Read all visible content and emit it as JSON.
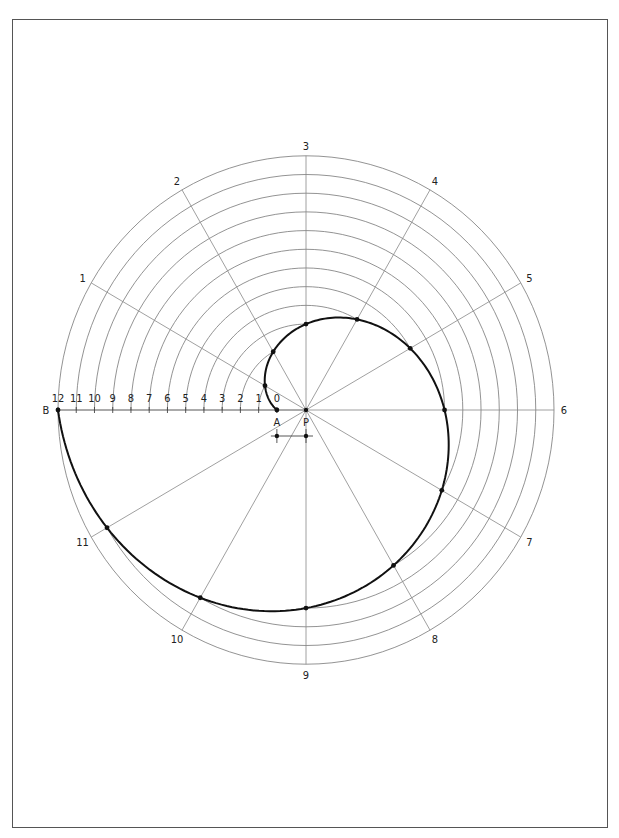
{
  "figure": {
    "center_label": "P",
    "start_label": "A",
    "end_label": "B",
    "divisions": 12,
    "ray_labels": [
      "1",
      "2",
      "3",
      "4",
      "5",
      "6",
      "7",
      "8",
      "9",
      "10",
      "11"
    ],
    "axis_tick_labels": [
      "0",
      "1",
      "2",
      "3",
      "4",
      "5",
      "6",
      "7",
      "8",
      "9",
      "10",
      "11",
      "12"
    ],
    "start_offset_fraction": 0.1174,
    "ray_step_degrees": 30,
    "colors": {
      "curve": "#111111",
      "grid": "#777777",
      "border": "#555555"
    }
  }
}
